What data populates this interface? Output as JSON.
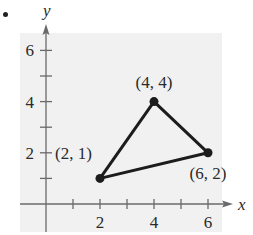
{
  "figure": {
    "bullet": "•",
    "background_color": "#f1f1f1",
    "line_color": "#1c1c1c",
    "axis_color": "#6a6a6a"
  },
  "chart_data": {
    "type": "scatter",
    "title": "",
    "xlabel": "x",
    "ylabel": "y",
    "xlim": [
      -0.9,
      7.2
    ],
    "ylim": [
      -0.9,
      7.0
    ],
    "x_ticks": [
      1,
      2,
      3,
      4,
      5,
      6
    ],
    "x_tick_labels": [
      "2",
      "4",
      "6"
    ],
    "x_labeled_ticks": [
      2,
      4,
      6
    ],
    "y_ticks": [
      1,
      2,
      3,
      4,
      5,
      6
    ],
    "y_tick_labels": [
      "2",
      "4",
      "6"
    ],
    "y_labeled_ticks": [
      2,
      4,
      6
    ],
    "grid": false,
    "legend": null,
    "series": [
      {
        "name": "triangle",
        "closed": true,
        "points": [
          {
            "x": 2,
            "y": 1,
            "label": "(2, 1)"
          },
          {
            "x": 4,
            "y": 4,
            "label": "(4, 4)"
          },
          {
            "x": 6,
            "y": 2,
            "label": "(6, 2)"
          }
        ]
      }
    ]
  }
}
